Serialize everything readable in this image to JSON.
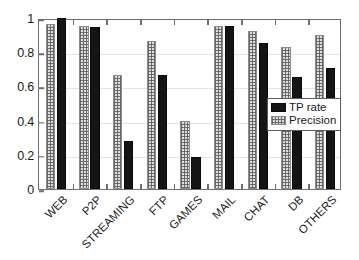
{
  "chart_data": {
    "type": "bar",
    "title": "",
    "subtitle": "",
    "xlabel": "",
    "ylabel": "",
    "categories": [
      "WEB",
      "P2P",
      "STREAMING",
      "FTP",
      "GAMES",
      "MAIL",
      "CHAT",
      "DB",
      "OTHERS"
    ],
    "series": [
      {
        "name": "Precision",
        "color": "#dedede",
        "values": [
          0.965,
          0.952,
          0.665,
          0.865,
          0.395,
          0.955,
          0.925,
          0.83,
          0.9
        ]
      },
      {
        "name": "TP rate",
        "color": "#151515",
        "values": [
          1.0,
          0.95,
          0.28,
          0.665,
          0.185,
          0.955,
          0.855,
          0.655,
          0.71
        ]
      }
    ],
    "ylim": [
      0,
      1
    ],
    "yticks": [
      0,
      0.2,
      0.4,
      0.6,
      0.8,
      1
    ],
    "ytick_labels": [
      "0",
      "0.2",
      "0.4",
      "0.6",
      "0.8",
      "1"
    ],
    "grid": true,
    "legend_position": "center-right",
    "legend_entries": [
      {
        "label": "TP rate",
        "swatch": "solid-black"
      },
      {
        "label": "Precision",
        "swatch": "dotted-light-gray"
      }
    ],
    "annotations": []
  },
  "legend": {
    "tp_rate_label": "TP rate",
    "precision_label": "Precision"
  }
}
